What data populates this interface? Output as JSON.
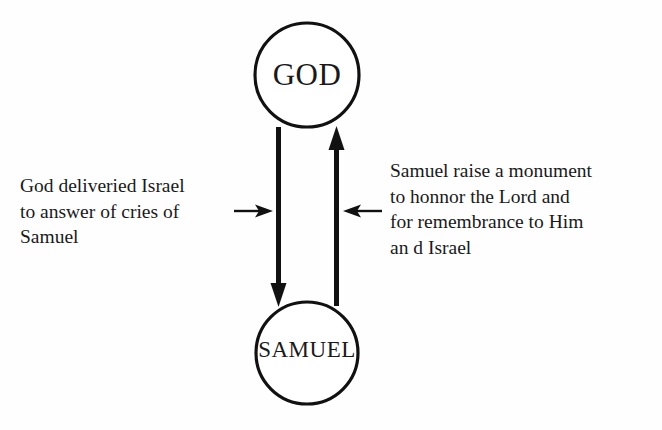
{
  "diagram": {
    "background_color": "#fefefe",
    "stroke_color": "#111111",
    "nodes": [
      {
        "id": "god",
        "label": "GOD",
        "shape": "circle",
        "cx": 307,
        "cy": 75,
        "r": 52
      },
      {
        "id": "samuel",
        "label": "SAMUEL",
        "shape": "circle",
        "cx": 307,
        "cy": 353,
        "r": 51
      }
    ],
    "edges": [
      {
        "id": "god-to-samuel",
        "from": "god",
        "to": "samuel",
        "direction": "down",
        "x": 278.5,
        "y_start": 128,
        "y_end": 305
      },
      {
        "id": "samuel-to-god",
        "from": "samuel",
        "to": "god",
        "direction": "up",
        "x": 336.5,
        "y_start": 305,
        "y_end": 128
      }
    ],
    "pointers": [
      {
        "id": "pointer-left",
        "direction": "right",
        "y": 211,
        "x_start": 234,
        "x_end": 272,
        "annotates": "annotation-left"
      },
      {
        "id": "pointer-right",
        "direction": "left",
        "y": 211,
        "x_start": 382,
        "x_end": 344,
        "annotates": "annotation-right"
      }
    ],
    "annotations": {
      "left": {
        "id": "annotation-left",
        "text": "God deliveried Israel\nto answer of  cries of\nSamuel",
        "lines": [
          "God deliveried Israel",
          "to answer of  cries of",
          "Samuel"
        ],
        "describes_edge": "god-to-samuel"
      },
      "right": {
        "id": "annotation-right",
        "text": "Samuel raise a monument\nto honnor the Lord and\nfor remembrance to Him\nan d Israel",
        "lines": [
          "Samuel raise a monument",
          "to honnor the Lord and",
          "for remembrance to Him",
          "an d Israel"
        ],
        "describes_edge": "samuel-to-god"
      }
    }
  }
}
